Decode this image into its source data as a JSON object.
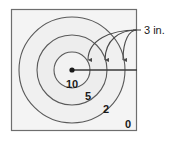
{
  "figure": {
    "type": "target-diagram",
    "title": "",
    "square": {
      "x": 11,
      "y": 9,
      "width": 126,
      "height": 122,
      "fill": "#f4f4f4",
      "stroke": "#6e6e6e"
    },
    "center": {
      "x": 72,
      "y": 70,
      "dot_color": "#1a1a1a"
    },
    "circles": [
      {
        "zone": "10",
        "radius": 18,
        "fill": "#f2f2f2",
        "stroke": "#5a5a5a"
      },
      {
        "zone": "5",
        "radius": 35,
        "fill": "#ededed",
        "stroke": "#5a5a5a"
      },
      {
        "zone": "2",
        "radius": 53,
        "fill": "#f0f0f0",
        "stroke": "#5a5a5a"
      }
    ],
    "zone_labels": [
      {
        "text": "10",
        "x": 72,
        "y": 88
      },
      {
        "text": "5",
        "x": 88,
        "y": 100
      },
      {
        "text": "2",
        "x": 106,
        "y": 113
      },
      {
        "text": "0",
        "x": 128,
        "y": 128
      }
    ],
    "radius_line": {
      "x1": 72,
      "y1": 70,
      "x2": 137,
      "y2": 70,
      "color": "#3a3a3a"
    },
    "dimension": {
      "label": "3 in.",
      "label_x": 144,
      "label_y": 34,
      "segment_count": 3,
      "arrow_color": "#4a4a4a",
      "arrows": [
        {
          "tip_x": 88,
          "tip_y": 70
        },
        {
          "tip_x": 105,
          "tip_y": 70
        },
        {
          "tip_x": 123,
          "tip_y": 70
        }
      ],
      "leader_anchor": {
        "x": 137,
        "y": 30
      }
    }
  }
}
